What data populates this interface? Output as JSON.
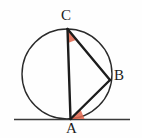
{
  "figure": {
    "background_color": "#fefefe",
    "stroke_color": "#1c1c1c",
    "circle_stroke_color": "#2a2a2a",
    "angle_marker_color": "#e06a52",
    "labels": {
      "C": "C",
      "B": "B",
      "A": "A"
    },
    "icons": {
      "angle_marker_c": "angle-wedge-icon",
      "angle_marker_a": "angle-wedge-icon"
    },
    "geometry": {
      "circle": {
        "cx": 67,
        "cy": 74,
        "r": 45,
        "stroke_width": 1.4
      },
      "points": {
        "C": {
          "x": 67.5,
          "y": 29
        },
        "B": {
          "x": 110,
          "y": 80
        },
        "A": {
          "x": 70.5,
          "y": 119
        }
      },
      "tangent_line": {
        "x1": 14,
        "y1": 119.5,
        "x2": 130,
        "y2": 119.5,
        "stroke_width": 1.3
      },
      "segments": [
        {
          "name": "CA",
          "from": "C",
          "to": "A",
          "stroke_width": 2.4
        },
        {
          "name": "CB",
          "from": "C",
          "to": "B",
          "stroke_width": 2.4
        },
        {
          "name": "AB",
          "from": "A",
          "to": "B",
          "stroke_width": 2.4
        }
      ],
      "angle_markers": [
        {
          "name": "angle-ACB",
          "vertex": "C",
          "radius": 14
        },
        {
          "name": "angle-BAT",
          "vertex": "A",
          "radius": 14
        }
      ]
    }
  }
}
